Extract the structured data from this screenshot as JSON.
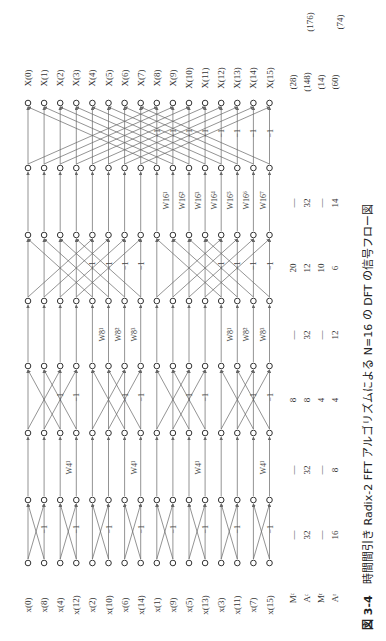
{
  "caption": {
    "figure_number": "図 3-4",
    "text": "時間間引き Radix-2 FFT アルゴリズムによる N=16 の DFT の信号フロー図"
  },
  "inputs": [
    "x(0)",
    "x(8)",
    "x(4)",
    "x(12)",
    "x(2)",
    "x(10)",
    "x(6)",
    "x(14)",
    "x(1)",
    "x(9)",
    "x(5)",
    "x(13)",
    "x(3)",
    "x(11)",
    "x(7)",
    "x(15)"
  ],
  "outputs": [
    "X(0)",
    "X(1)",
    "X(2)",
    "X(3)",
    "X(4)",
    "X(5)",
    "X(6)",
    "X(7)",
    "X(8)",
    "X(9)",
    "X(10)",
    "X(11)",
    "X(12)",
    "X(13)",
    "X(14)",
    "X(15)"
  ],
  "stages": [
    {
      "name": "stage-1",
      "span": 1,
      "twiddle_label": "W4",
      "twiddles": [],
      "neg_label": "−1"
    },
    {
      "name": "stage-2",
      "span": 2,
      "twiddles": [
        "W4¹"
      ],
      "neg_label": "−1"
    },
    {
      "name": "stage-3",
      "span": 4,
      "twiddles": [
        "W8¹",
        "W8²",
        "W8³"
      ],
      "neg_label": "−1"
    },
    {
      "name": "stage-4",
      "span": 8,
      "twiddles": [
        "W16¹",
        "W16²",
        "W16³",
        "W16⁴",
        "W16⁵",
        "W16⁶",
        "W16⁷"
      ],
      "neg_label": "−1"
    }
  ],
  "ops_table": {
    "row_labels": [
      "Mᶜ",
      "Aᶜ",
      "Mʳ",
      "Aʳ"
    ],
    "columns": [
      {
        "values": [
          "—",
          "32",
          "—",
          "16"
        ]
      },
      {
        "values": [
          "—",
          "32",
          "—",
          "8"
        ]
      },
      {
        "values": [
          "8",
          "8",
          "4",
          "4"
        ]
      },
      {
        "values": [
          "—",
          "32",
          "—",
          "12"
        ]
      },
      {
        "values": [
          "20",
          "12",
          "10",
          "6"
        ]
      },
      {
        "values": [
          "—",
          "32",
          "—",
          "14"
        ]
      }
    ],
    "subtotals": [
      "(28)",
      "(148)",
      "(14)",
      "(60)"
    ],
    "totals": [
      "(176)",
      "(74)"
    ]
  }
}
